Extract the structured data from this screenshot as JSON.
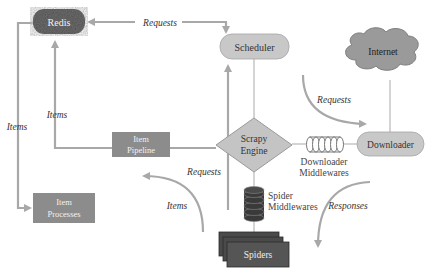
{
  "diagram": {
    "colors": {
      "background": "#ffffff",
      "arrow": "#a8a8a8",
      "line": "#b0b0b0",
      "redis_fill": "#6e6e6e",
      "item_box_fill": "#8c8c8c",
      "light_node_fill": "#c8c8c8",
      "engine_fill": "#c4c4c4",
      "cloud_fill": "#9a9a9a",
      "spiders_fill": "#4a4a4a",
      "dark_text": "#333333",
      "light_text": "#f2f2f2"
    },
    "nodes": {
      "redis": "Redis",
      "scheduler": "Scheduler",
      "internet": "Internet",
      "engine_line1": "Scrapy",
      "engine_line2": "Engine",
      "downloader": "Downloader",
      "item_pipeline_line1": "Item",
      "item_pipeline_line2": "Pipeline",
      "item_processes_line1": "Item",
      "item_processes_line2": "Processes",
      "spiders": "Spiders",
      "downloader_mw_line1": "Downloader",
      "downloader_mw_line2": "Middlewares",
      "spider_mw_line1": "Spider",
      "spider_mw_line2": "Middlewares"
    },
    "edge_labels": {
      "requests_to_redis": "Requests",
      "items_to_redis": "Items",
      "items_to_processes": "Items",
      "requests_to_downloader": "Requests",
      "requests_from_spiders": "Requests",
      "items_from_spiders": "Items",
      "responses": "Responses"
    }
  }
}
